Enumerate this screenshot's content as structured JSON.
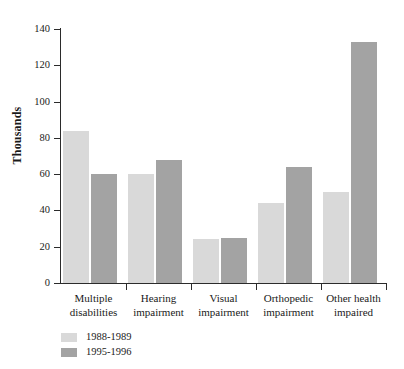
{
  "chart_data": {
    "type": "bar",
    "title": "",
    "subtitle": "",
    "xlabel": "",
    "ylabel": "Thousands",
    "ylim": [
      0,
      140
    ],
    "yticks": [
      0,
      20,
      40,
      60,
      80,
      100,
      120,
      140
    ],
    "ytick_labels": [
      "0",
      "20",
      "40",
      "60",
      "80",
      "100",
      "120",
      "140"
    ],
    "grid": false,
    "legend_position": "bottom-left",
    "orientation": "vertical",
    "grouping": "grouped",
    "categories": [
      "Multiple disabilities",
      "Hearing impairment",
      "Visual impairment",
      "Orthopedic impairment",
      "Other health impaired"
    ],
    "category_lines": [
      [
        "Multiple",
        "disabilities"
      ],
      [
        "Hearing",
        "impairment"
      ],
      [
        "Visual",
        "impairment"
      ],
      [
        "Orthopedic",
        "impairment"
      ],
      [
        "Other health",
        "impaired"
      ]
    ],
    "series": [
      {
        "name": "1988-1989",
        "color": "#d9d9d9",
        "values": [
          84,
          60,
          24,
          44,
          50
        ]
      },
      {
        "name": "1995-1996",
        "color": "#a3a3a3",
        "values": [
          60,
          68,
          25,
          64,
          133
        ]
      }
    ]
  },
  "legend": {
    "items": [
      {
        "label": "1988-1989",
        "color": "#d9d9d9"
      },
      {
        "label": "1995-1996",
        "color": "#a3a3a3"
      }
    ]
  },
  "axis": {
    "y_title": "Thousands"
  },
  "colors": {
    "series_1988_1989": "#d9d9d9",
    "series_1995_1996": "#a3a3a3",
    "axis": "#2b2b2b",
    "text": "#1a1a1a",
    "background": "#ffffff"
  }
}
